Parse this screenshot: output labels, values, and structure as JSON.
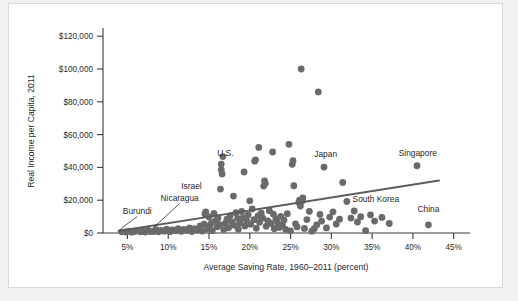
{
  "chart_data": {
    "type": "scatter",
    "title": "",
    "xlabel": "Average Saving Rate, 1960–2011 (percent)",
    "ylabel": "Real Income per Capita, 2011",
    "xlim": [
      2,
      47
    ],
    "ylim": [
      0,
      125000
    ],
    "grid": false,
    "legend": "none",
    "xticks": [
      "5%",
      "10%",
      "15%",
      "20%",
      "25%",
      "30%",
      "35%",
      "40%",
      "45%"
    ],
    "xtick_values": [
      5,
      10,
      15,
      20,
      25,
      30,
      35,
      40,
      45
    ],
    "yticks": [
      "$0",
      "$20,000",
      "$40,000",
      "$60,000",
      "$80,000",
      "$100,000",
      "$120,000"
    ],
    "ytick_values": [
      0,
      20000,
      40000,
      60000,
      80000,
      100000,
      120000
    ],
    "marker_color": "#6a6a6a",
    "trendline_color": "#5d5d5d",
    "trendline": {
      "x_start": 3.9,
      "y_start": 1200,
      "x_end": 43.2,
      "y_end": 32000
    },
    "annotations": [
      {
        "label": "Burundi",
        "text_x": 6.2,
        "text_y": 11500,
        "point_x": 4.3,
        "point_y": 700,
        "leader": true,
        "anchor": "middle"
      },
      {
        "label": "Nicaragua",
        "text_x": 11.4,
        "text_y": 19500,
        "point_x": 8.2,
        "point_y": 900,
        "leader": true,
        "anchor": "middle"
      },
      {
        "label": "Israel",
        "text_x": 14.1,
        "text_y": 26800,
        "point_x": 16.4,
        "point_y": 26800,
        "leader": false,
        "anchor": "end"
      },
      {
        "label": "U.S.",
        "text_x": 17.0,
        "text_y": 46800,
        "point_x": 16.6,
        "point_y": 42000,
        "leader": false,
        "anchor": "middle"
      },
      {
        "label": "Japan",
        "text_x": 29.3,
        "text_y": 46500,
        "point_x": 29.1,
        "point_y": 40200,
        "leader": false,
        "anchor": "middle"
      },
      {
        "label": "Singapore",
        "text_x": 40.6,
        "text_y": 46800,
        "point_x": 40.5,
        "point_y": 41000,
        "leader": false,
        "anchor": "middle"
      },
      {
        "label": "South Korea",
        "text_x": 32.6,
        "text_y": 19200,
        "point_x": 31.9,
        "point_y": 19200,
        "leader": false,
        "anchor": "start"
      },
      {
        "label": "China",
        "text_x": 41.9,
        "text_y": 12600,
        "point_x": 41.9,
        "point_y": 5000,
        "leader": false,
        "anchor": "middle"
      }
    ],
    "points": [
      [
        4.3,
        700
      ],
      [
        4.8,
        600
      ],
      [
        5.2,
        1100
      ],
      [
        5.5,
        500
      ],
      [
        5.9,
        900
      ],
      [
        6.2,
        1500
      ],
      [
        6.6,
        700
      ],
      [
        6.9,
        1200
      ],
      [
        7.2,
        600
      ],
      [
        7.5,
        1800
      ],
      [
        7.8,
        900
      ],
      [
        8.2,
        900
      ],
      [
        8.5,
        2100
      ],
      [
        8.8,
        700
      ],
      [
        9.1,
        1600
      ],
      [
        9.5,
        1100
      ],
      [
        9.8,
        2400
      ],
      [
        10.2,
        800
      ],
      [
        10.5,
        1900
      ],
      [
        10.9,
        1300
      ],
      [
        11.2,
        2600
      ],
      [
        11.6,
        1000
      ],
      [
        11.9,
        2200
      ],
      [
        12.3,
        1500
      ],
      [
        12.6,
        3100
      ],
      [
        12.9,
        900
      ],
      [
        13.2,
        2700
      ],
      [
        13.6,
        1800
      ],
      [
        13.9,
        4300
      ],
      [
        14.2,
        1200
      ],
      [
        14.4,
        5400
      ],
      [
        14.5,
        11600
      ],
      [
        14.6,
        12800
      ],
      [
        14.8,
        2400
      ],
      [
        15.0,
        9800
      ],
      [
        15.1,
        4500
      ],
      [
        15.3,
        6200
      ],
      [
        15.4,
        1400
      ],
      [
        15.6,
        11900
      ],
      [
        15.8,
        7600
      ],
      [
        16.0,
        3800
      ],
      [
        16.1,
        9200
      ],
      [
        16.3,
        5100
      ],
      [
        16.4,
        26800
      ],
      [
        16.5,
        42000
      ],
      [
        16.5,
        38600
      ],
      [
        16.6,
        36000
      ],
      [
        16.7,
        46600
      ],
      [
        16.8,
        2100
      ],
      [
        17.0,
        5900
      ],
      [
        17.2,
        8400
      ],
      [
        17.4,
        3200
      ],
      [
        17.6,
        10600
      ],
      [
        17.8,
        6800
      ],
      [
        18.0,
        22500
      ],
      [
        18.1,
        4700
      ],
      [
        18.3,
        12400
      ],
      [
        18.5,
        8900
      ],
      [
        18.6,
        2300
      ],
      [
        18.8,
        6100
      ],
      [
        19.0,
        13100
      ],
      [
        19.2,
        9400
      ],
      [
        19.3,
        37200
      ],
      [
        19.4,
        4200
      ],
      [
        19.6,
        7700
      ],
      [
        19.8,
        11200
      ],
      [
        20.0,
        19600
      ],
      [
        20.1,
        5300
      ],
      [
        20.3,
        14700
      ],
      [
        20.5,
        8100
      ],
      [
        20.6,
        43800
      ],
      [
        20.7,
        44600
      ],
      [
        20.8,
        2900
      ],
      [
        21.0,
        10400
      ],
      [
        21.1,
        52200
      ],
      [
        21.2,
        6500
      ],
      [
        21.4,
        12100
      ],
      [
        21.6,
        9100
      ],
      [
        21.7,
        28600
      ],
      [
        21.8,
        31800
      ],
      [
        21.9,
        30200
      ],
      [
        22.0,
        4100
      ],
      [
        22.2,
        7400
      ],
      [
        22.4,
        13600
      ],
      [
        22.6,
        5800
      ],
      [
        22.8,
        49400
      ],
      [
        22.9,
        11500
      ],
      [
        23.0,
        2600
      ],
      [
        23.2,
        8700
      ],
      [
        23.4,
        6300
      ],
      [
        23.6,
        3400
      ],
      [
        23.8,
        10100
      ],
      [
        24.0,
        5000
      ],
      [
        24.2,
        7900
      ],
      [
        24.4,
        2200
      ],
      [
        24.6,
        11800
      ],
      [
        24.8,
        54100
      ],
      [
        25.0,
        1300
      ],
      [
        25.2,
        41900
      ],
      [
        25.3,
        44100
      ],
      [
        25.4,
        28800
      ],
      [
        25.6,
        5600
      ],
      [
        25.8,
        3700
      ],
      [
        26.0,
        18700
      ],
      [
        26.1,
        20100
      ],
      [
        26.2,
        16400
      ],
      [
        26.3,
        100000
      ],
      [
        26.4,
        19300
      ],
      [
        26.5,
        21400
      ],
      [
        26.7,
        2800
      ],
      [
        27.0,
        8200
      ],
      [
        27.3,
        13200
      ],
      [
        27.6,
        1100
      ],
      [
        27.9,
        2600
      ],
      [
        28.2,
        4900
      ],
      [
        28.4,
        86000
      ],
      [
        28.6,
        11300
      ],
      [
        28.8,
        7200
      ],
      [
        29.1,
        40200
      ],
      [
        29.4,
        3100
      ],
      [
        29.8,
        9700
      ],
      [
        30.2,
        12900
      ],
      [
        30.6,
        5500
      ],
      [
        31.0,
        8400
      ],
      [
        31.4,
        30800
      ],
      [
        31.9,
        19200
      ],
      [
        32.4,
        9100
      ],
      [
        32.8,
        13400
      ],
      [
        33.2,
        6700
      ],
      [
        33.6,
        9900
      ],
      [
        34.2,
        1400
      ],
      [
        34.8,
        11100
      ],
      [
        35.3,
        7300
      ],
      [
        36.2,
        9500
      ],
      [
        37.1,
        5800
      ],
      [
        40.5,
        41000
      ],
      [
        41.9,
        5000
      ]
    ]
  }
}
